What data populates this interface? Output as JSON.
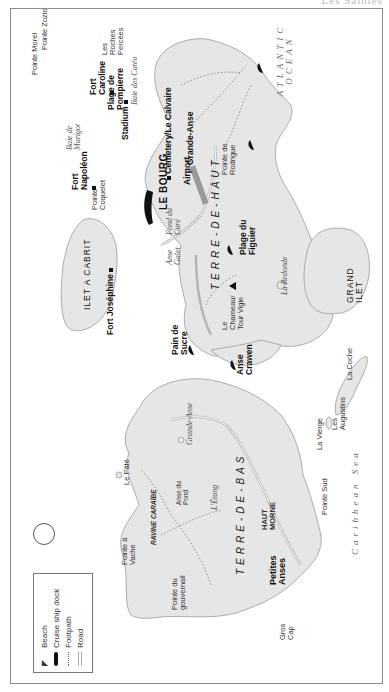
{
  "header": {
    "text": "Les Saintes"
  },
  "legend": {
    "items": [
      {
        "label": "Beach",
        "icon": "beach-umbrella-icon"
      },
      {
        "label": "Cruise ship dock",
        "icon": "cruise-ship-icon"
      },
      {
        "label": "Footpath",
        "icon": "dotted-line"
      },
      {
        "label": "Road",
        "icon": "double-line"
      }
    ]
  },
  "compass": {
    "icon": "north-arrow-icon"
  },
  "islands": {
    "terre_de_haut": "TERRE-DE-HAUT",
    "terre_de_bas": "TERRE-DE-BAS",
    "ilet_a_cabrit": "ILET A CABRIT",
    "grand_ilet": "GRAND ILET"
  },
  "seas": {
    "atlantic_line1": "ATLANTIC",
    "atlantic_line2": "OCEAN",
    "caribbean": "Caribbean Sea"
  },
  "towns": {
    "le_bourg": "LE BOURG",
    "petites_anses": "Petites Anses"
  },
  "landmarks": {
    "fort_caroline": "Fort Caroline",
    "stadium": "Stadium",
    "cemetery": "Cemetery/Le Calvaire",
    "airport": "Airport",
    "fort_napoleon": "Fort Napoléon",
    "fort_josephine": "Fort Joséphine",
    "le_chameau": "Le Chameau/ Tour Vigie",
    "haut_morne": "HAUT MORNE",
    "ravine_caraibe": "RAVINE CARAÏBE",
    "anse_pond": "Anse du Pond"
  },
  "beaches": {
    "plage_pompierre": "Plage de Pompierre",
    "grande_anse": "Grande-Anse",
    "plage_figuier": "Plage du Figuier",
    "pain_de_sucre": "Pain de Sucre",
    "anse_crawen": "Anse Crawen"
  },
  "places": {
    "pointe_morel": "Pointe Morel",
    "pointe_zozio": "Pointe Zozio",
    "roches_percees": "Les Roches Percées",
    "baie_marigot": "Baie de Marigot",
    "baie_cateau": "Baie des Catéo",
    "pointe_rodrigue": "Pointe de Rodrigue",
    "pointe_coquelet": "Pointe Coquelet",
    "fond_cure": "Fond du Curé",
    "anse_galet": "Anse Galet",
    "la_redonde": "La Redonde",
    "la_coche": "La Coche",
    "les_augustins": "Les Augustins",
    "la_vierge": "La Vierge",
    "le_pate": "Le Pâté",
    "grande_anse_bas": "Grande-Anse",
    "l_etang": "L'Étang",
    "pointe_sud": "Pointe Sud",
    "pointe_vache": "Pointe à Vache",
    "pointe_gouvernail": "Pointe du gouvernail",
    "gros_cap": "Gros Cap"
  }
}
